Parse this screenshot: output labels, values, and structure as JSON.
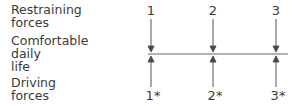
{
  "labels": {
    "restraining": "Restraining forces",
    "comfortable": "Comfortable daily life",
    "driving": "Driving forces"
  },
  "restraining_lines": [
    "Restraining",
    "forces"
  ],
  "comfortable_lines": [
    "Comfortable",
    "daily",
    "life"
  ],
  "driving_lines": [
    "Driving",
    "forces"
  ],
  "restraining_forces": [
    "1",
    "2",
    "3"
  ],
  "driving_forces": [
    "1*",
    "2*",
    "3*"
  ]
}
